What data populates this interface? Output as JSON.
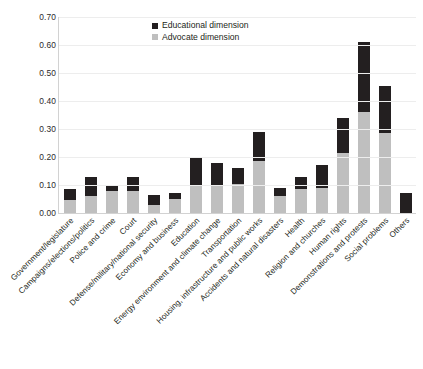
{
  "chart_data": {
    "type": "bar",
    "subtype": "stacked-vertical",
    "title": "",
    "xlabel": "",
    "ylabel": "",
    "ylim": [
      0.0,
      0.7
    ],
    "ytick_step": 0.1,
    "ytick_labels": [
      "0.70",
      "0.60",
      "0.50",
      "0.40",
      "0.30",
      "0.20",
      "0.10",
      "0.00"
    ],
    "ytick_values": [
      0.7,
      0.6,
      0.5,
      0.4,
      0.3,
      0.2,
      0.1,
      0.0
    ],
    "grid": "horizontal",
    "legend_position": "top-center",
    "categories": [
      "Government/legislature",
      "Campaigns/elections/politics",
      "Police and crime",
      "Court",
      "Defense/military/national security",
      "Economy and business",
      "Education",
      "Energy environment and climate change",
      "Transportation",
      "Housing, infrastructure and public works",
      "Accidents and natural disasters",
      "Health",
      "Religion and churches",
      "Human rights",
      "Demonstrations and protests",
      "Social problems",
      "Others"
    ],
    "series": [
      {
        "name": "Advocate dimension",
        "color": "#bfbfbf",
        "values": [
          0.045,
          0.06,
          0.08,
          0.08,
          0.03,
          0.05,
          0.1,
          0.1,
          0.105,
          0.185,
          0.06,
          0.085,
          0.09,
          0.215,
          0.36,
          0.285,
          0.0
        ]
      },
      {
        "name": "Educational dimension",
        "color": "#231f20",
        "values": [
          0.04,
          0.07,
          0.02,
          0.05,
          0.035,
          0.02,
          0.095,
          0.08,
          0.055,
          0.105,
          0.03,
          0.045,
          0.08,
          0.125,
          0.25,
          0.17,
          0.07
        ]
      }
    ],
    "totals": [
      0.085,
      0.13,
      0.1,
      0.13,
      0.065,
      0.07,
      0.195,
      0.18,
      0.16,
      0.29,
      0.09,
      0.13,
      0.17,
      0.34,
      0.61,
      0.455,
      0.07
    ]
  },
  "legend": {
    "items": [
      {
        "label": "Educational dimension",
        "color": "#231f20",
        "swatch": "square-swatch-dark"
      },
      {
        "label": "Advocate dimension",
        "color": "#bfbfbf",
        "swatch": "square-swatch-light"
      }
    ]
  },
  "caption": {
    "text": ""
  }
}
